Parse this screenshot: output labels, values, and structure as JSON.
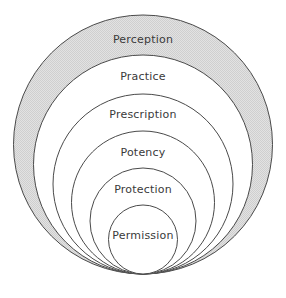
{
  "diagram": {
    "type": "nested-circles-tangent-bottom",
    "canvas": {
      "width": 286,
      "height": 298,
      "background": "#ffffff"
    },
    "geometry": {
      "center_x": 143,
      "tangent_y": 274,
      "note": "All circles share a common bottom tangent point"
    },
    "colors": {
      "stroke": "#4a4a4a",
      "outer_fill": "#d9d9d9",
      "inner_fill": "#ffffff",
      "text": "#3a3a3a"
    },
    "rings": [
      {
        "label": "Perception",
        "level": 1,
        "top_y": 15,
        "diameter": 259,
        "fill": "#d9d9d9",
        "label_y": 33
      },
      {
        "label": "Practice",
        "level": 2,
        "top_y": 55,
        "diameter": 219,
        "fill": "#ffffff",
        "label_y": 70
      },
      {
        "label": "Prescription",
        "level": 3,
        "top_y": 94,
        "diameter": 180,
        "fill": "#ffffff",
        "label_y": 108
      },
      {
        "label": "Potency",
        "level": 4,
        "top_y": 131,
        "diameter": 143,
        "fill": "#ffffff",
        "label_y": 146
      },
      {
        "label": "Protection",
        "level": 5,
        "top_y": 168,
        "diameter": 106,
        "fill": "#ffffff",
        "label_y": 183
      },
      {
        "label": "Permission",
        "level": 6,
        "top_y": 205,
        "diameter": 69,
        "fill": "#ffffff",
        "label_y": 229
      }
    ]
  }
}
